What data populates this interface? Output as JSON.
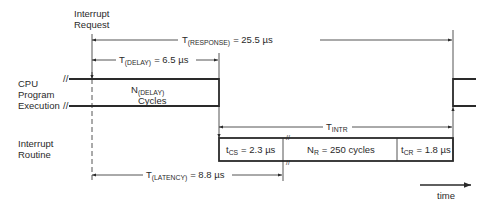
{
  "diagram": {
    "type": "timing-diagram",
    "labels": {
      "interrupt_request": [
        "Interrupt",
        "Request"
      ],
      "cpu_program_execution": [
        "CPU",
        "Program",
        "Execution"
      ],
      "interrupt_routine": [
        "Interrupt",
        "Routine"
      ],
      "time": "time"
    },
    "timings": {
      "response": {
        "symbol": "T",
        "subscript": "(RESPONSE)",
        "value": "= 25.5 µs"
      },
      "delay": {
        "symbol": "T",
        "subscript": "(DELAY)",
        "value": "= 6.5 µs"
      },
      "intr": {
        "symbol": "T",
        "subscript": "INTR",
        "value": ""
      },
      "latency": {
        "symbol": "T",
        "subscript": "(LATENCY)",
        "value": "= 8.8 µs"
      }
    },
    "cpu_block": {
      "symbol": "N",
      "subscript": "(DELAY)",
      "line2": "Cycles"
    },
    "routine_segments": [
      {
        "symbol": "t",
        "subscript": "CS",
        "value": "= 2.3 µs"
      },
      {
        "symbol": "N",
        "subscript": "R",
        "value": "= 250 cycles"
      },
      {
        "symbol": "t",
        "subscript": "CR",
        "value": "= 1.8 µs"
      }
    ],
    "break_mark": "//"
  }
}
